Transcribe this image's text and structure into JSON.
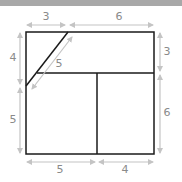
{
  "diagram": {
    "colors": {
      "shape": "#1a1a1a",
      "dimension": "#c4c4c4",
      "label": "#8a8a8a",
      "topbar": "#a8a8a8"
    },
    "dimensions": {
      "top_left": "3",
      "top_right": "6",
      "left_upper": "4",
      "left_lower": "5",
      "right_upper": "3",
      "right_lower": "6",
      "bottom_left": "5",
      "bottom_right": "4",
      "diagonal": "5"
    }
  }
}
